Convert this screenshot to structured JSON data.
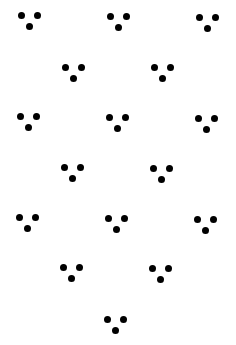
{
  "canvas": {
    "width": 236,
    "height": 345,
    "background": "#ffffff",
    "dot_color": "#000000",
    "dot_diameter": 7
  },
  "pattern": {
    "description": "Staggered grid of three-dot triangular clusters (two dots on top, one below center)",
    "cluster_shape": "three-dots-downward-triangle",
    "dot_offsets": [
      [
        -8,
        0
      ],
      [
        8,
        0
      ],
      [
        0,
        11
      ]
    ],
    "clusters": [
      {
        "row": 1,
        "col": 1,
        "x": 29,
        "y": 15
      },
      {
        "row": 1,
        "col": 2,
        "x": 118,
        "y": 16
      },
      {
        "row": 1,
        "col": 3,
        "x": 207,
        "y": 17
      },
      {
        "row": 2,
        "col": 1,
        "x": 73,
        "y": 67
      },
      {
        "row": 2,
        "col": 2,
        "x": 162,
        "y": 67
      },
      {
        "row": 3,
        "col": 1,
        "x": 28,
        "y": 116
      },
      {
        "row": 3,
        "col": 2,
        "x": 117,
        "y": 117
      },
      {
        "row": 3,
        "col": 3,
        "x": 206,
        "y": 118
      },
      {
        "row": 4,
        "col": 1,
        "x": 72,
        "y": 167
      },
      {
        "row": 4,
        "col": 2,
        "x": 161,
        "y": 168
      },
      {
        "row": 5,
        "col": 1,
        "x": 27,
        "y": 217
      },
      {
        "row": 5,
        "col": 2,
        "x": 116,
        "y": 218
      },
      {
        "row": 5,
        "col": 3,
        "x": 205,
        "y": 219
      },
      {
        "row": 6,
        "col": 1,
        "x": 71,
        "y": 267
      },
      {
        "row": 6,
        "col": 2,
        "x": 160,
        "y": 268
      },
      {
        "row": 7,
        "col": 1,
        "x": 115,
        "y": 319
      }
    ]
  }
}
